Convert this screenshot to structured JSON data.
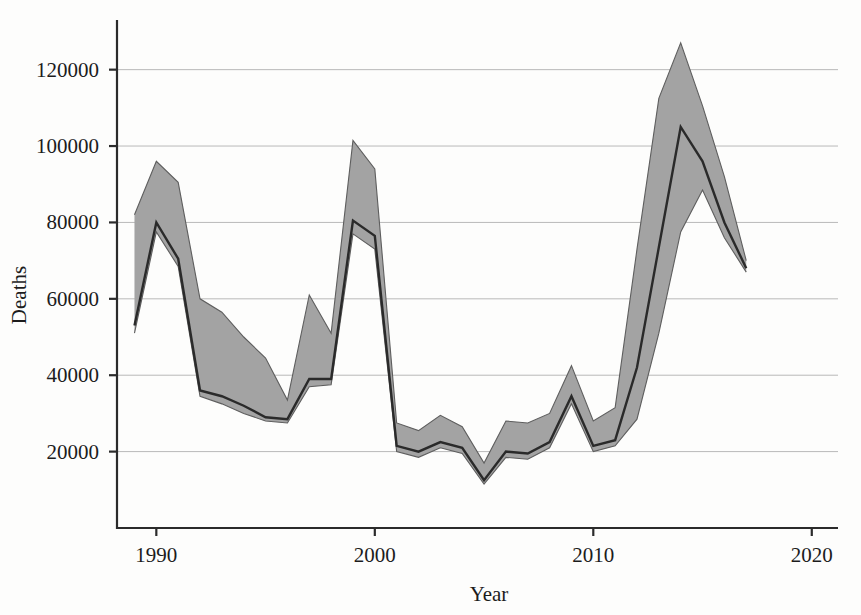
{
  "chart_data": {
    "type": "line",
    "title": "",
    "subtitle": "",
    "xlabel": "Year",
    "ylabel": "Deaths",
    "xlim": [
      1988.2,
      2021.2
    ],
    "ylim": [
      0,
      133000
    ],
    "grid": true,
    "grid_axis": "y",
    "legend": "none",
    "annotations": [],
    "x_ticks": [
      1990,
      2000,
      2010,
      2020
    ],
    "x_tick_labels": [
      "1990",
      "2000",
      "2010",
      "2020"
    ],
    "y_ticks": [
      20000,
      40000,
      60000,
      80000,
      100000,
      120000
    ],
    "y_tick_labels": [
      "20000",
      "40000",
      "60000",
      "80000",
      "100000",
      "120000"
    ],
    "x": [
      1989,
      1990,
      1991,
      1992,
      1993,
      1994,
      1995,
      1996,
      1997,
      1998,
      1999,
      2000,
      2001,
      2002,
      2003,
      2004,
      2005,
      2006,
      2007,
      2008,
      2009,
      2010,
      2011,
      2012,
      2013,
      2014,
      2015,
      2016,
      2017
    ],
    "series": [
      {
        "name": "Deaths (central estimate)",
        "style": "solid-dark-line",
        "values": [
          53000,
          80000,
          70500,
          36000,
          34500,
          32000,
          29000,
          28500,
          39000,
          39000,
          80500,
          76500,
          21500,
          20000,
          22500,
          21000,
          12500,
          20000,
          19500,
          22500,
          34500,
          21500,
          23000,
          42000,
          73500,
          105000,
          96000,
          80000,
          68000
        ]
      },
      {
        "name": "Uncertainty band upper",
        "style": "grey-band-upper",
        "values": [
          82000,
          96000,
          90500,
          60000,
          56500,
          50000,
          44500,
          33500,
          61000,
          51000,
          101500,
          94000,
          27500,
          25500,
          29500,
          26500,
          17000,
          28000,
          27500,
          30000,
          42500,
          28000,
          31500,
          73000,
          112500,
          127000,
          110500,
          92000,
          70000
        ]
      },
      {
        "name": "Uncertainty band lower",
        "style": "grey-band-lower",
        "values": [
          51000,
          77500,
          68500,
          34500,
          32500,
          30000,
          28000,
          27500,
          37000,
          37500,
          77000,
          73000,
          20000,
          18500,
          21000,
          19500,
          11500,
          18500,
          18000,
          21000,
          32500,
          20000,
          21500,
          28500,
          51000,
          77500,
          88500,
          76000,
          67000
        ]
      }
    ]
  },
  "axes": {
    "y_label": "Deaths",
    "x_label": "Year"
  }
}
